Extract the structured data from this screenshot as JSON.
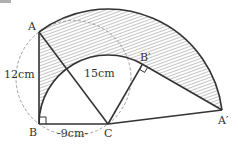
{
  "figure": {
    "points": {
      "A": {
        "label": "A",
        "x": 39,
        "y": 32
      },
      "B": {
        "label": "B",
        "x": 39,
        "y": 124
      },
      "C": {
        "label": "C",
        "x": 108,
        "y": 124
      },
      "A_prime": {
        "label": "A′",
        "x": 222,
        "y": 110
      },
      "B_prime": {
        "label": "B′",
        "x": 142.5,
        "y": 64.2
      }
    },
    "measurements": {
      "AB": "12cm",
      "AC": "15cm",
      "BC": "-9cm-"
    },
    "right_angles": [
      "B",
      "B′"
    ],
    "colors": {
      "line": "#333333",
      "dashed": "#888888",
      "hatch": "#555555",
      "background": "#ffffff"
    }
  }
}
